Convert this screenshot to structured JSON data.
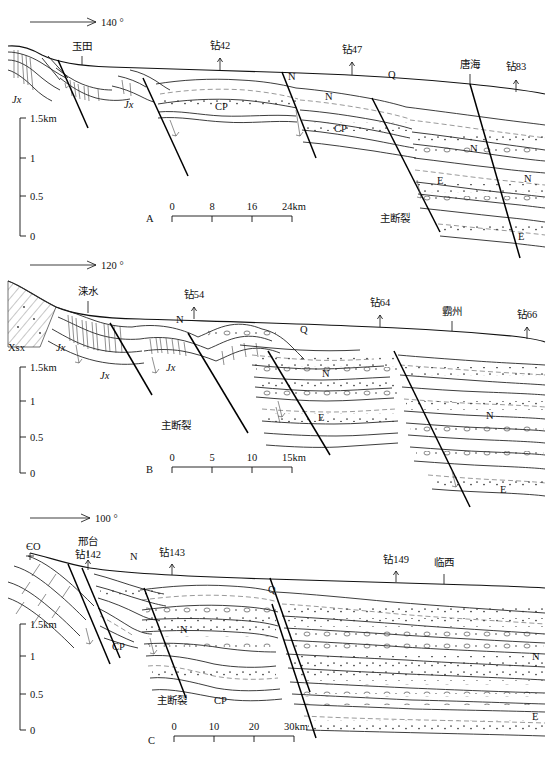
{
  "figure": {
    "type": "geological-cross-sections",
    "panel_count": 3
  },
  "panels": [
    {
      "id": "A",
      "panel_label": "A",
      "azimuth_label": "140 °",
      "vertical_axis": {
        "unit_top_label": "1.5km",
        "ticks": [
          "1.5km",
          "1",
          "0.5",
          "0"
        ]
      },
      "scale_bar": {
        "ticks": [
          "0",
          "8",
          "16",
          "24km"
        ]
      },
      "surface_markers": [
        {
          "name": "玉田",
          "kind": "town"
        },
        {
          "name": "钻42",
          "kind": "borehole"
        },
        {
          "name": "钻47",
          "kind": "borehole"
        },
        {
          "name": "唐海",
          "kind": "town"
        },
        {
          "name": "钻83",
          "kind": "borehole"
        }
      ],
      "unit_labels": [
        {
          "text": "Jx"
        },
        {
          "text": "Jx"
        },
        {
          "text": "CP"
        },
        {
          "text": "N"
        },
        {
          "text": "N"
        },
        {
          "text": "CP"
        },
        {
          "text": "Q"
        },
        {
          "text": "N"
        },
        {
          "text": "E"
        },
        {
          "text": "N"
        },
        {
          "text": "E"
        }
      ],
      "fault_labels": [
        "主断裂"
      ]
    },
    {
      "id": "B",
      "panel_label": "B",
      "azimuth_label": "120 °",
      "vertical_axis": {
        "unit_top_label": "1.5km",
        "ticks": [
          "1.5km",
          "1",
          "0.5",
          "0"
        ]
      },
      "scale_bar": {
        "ticks": [
          "0",
          "5",
          "10",
          "15km"
        ]
      },
      "surface_markers": [
        {
          "name": "涞水",
          "kind": "town"
        },
        {
          "name": "钻54",
          "kind": "borehole"
        },
        {
          "name": "钻64",
          "kind": "borehole"
        },
        {
          "name": "霸州",
          "kind": "town"
        },
        {
          "name": "钻66",
          "kind": "borehole"
        }
      ],
      "unit_labels": [
        {
          "text": "Xsx"
        },
        {
          "text": "Jx"
        },
        {
          "text": "Jx"
        },
        {
          "text": "Jx"
        },
        {
          "text": "N"
        },
        {
          "text": "Q"
        },
        {
          "text": "N"
        },
        {
          "text": "E"
        },
        {
          "text": "N"
        },
        {
          "text": "E"
        }
      ],
      "fault_labels": [
        "主断裂"
      ]
    },
    {
      "id": "C",
      "panel_label": "C",
      "azimuth_label": "100 °",
      "vertical_axis": {
        "unit_top_label": "1.5km",
        "ticks": [
          "1.5km",
          "1",
          "0.5",
          "0"
        ]
      },
      "scale_bar": {
        "ticks": [
          "0",
          "10",
          "20",
          "30km"
        ]
      },
      "surface_markers": [
        {
          "name": "邢台",
          "kind": "town"
        },
        {
          "name": "钻142",
          "kind": "borehole"
        },
        {
          "name": "钻143",
          "kind": "borehole"
        },
        {
          "name": "钻149",
          "kind": "borehole"
        },
        {
          "name": "临西",
          "kind": "town"
        }
      ],
      "unit_labels": [
        {
          "text": "ЄO"
        },
        {
          "text": "N"
        },
        {
          "text": "Q"
        },
        {
          "text": "CP"
        },
        {
          "text": "N"
        },
        {
          "text": "CP"
        },
        {
          "text": "N"
        },
        {
          "text": "E"
        }
      ],
      "fault_labels": [
        "主断裂"
      ]
    }
  ],
  "colors": {
    "line": "#1a1a1a",
    "thin_line": "#444444",
    "dashed_line": "#555555",
    "background": "#ffffff"
  }
}
